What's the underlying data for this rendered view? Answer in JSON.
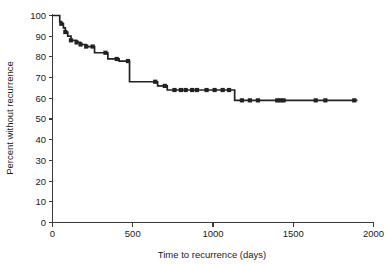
{
  "chart_data": {
    "type": "line",
    "title": "",
    "subtitle": "",
    "xlabel": "Time to recurrence (days)",
    "ylabel": "Percent without recurrence",
    "xlim": [
      0,
      2000
    ],
    "ylim": [
      0,
      100
    ],
    "xticks": [
      0,
      500,
      1000,
      1500,
      2000
    ],
    "xtick_labels": [
      "0",
      "500",
      "1000",
      "1500",
      "2000"
    ],
    "yticks": [
      0,
      10,
      20,
      30,
      40,
      50,
      60,
      70,
      80,
      90,
      100
    ],
    "ytick_labels": [
      "0",
      "10",
      "20",
      "30",
      "40",
      "50",
      "60",
      "70",
      "80",
      "90",
      "100"
    ],
    "grid": false,
    "legend": null,
    "legend_position": "none",
    "curve_style": "kaplan-meier step function with censoring marks",
    "series": [
      {
        "name": "Percent without recurrence",
        "step_points": [
          [
            0,
            100
          ],
          [
            40,
            100
          ],
          [
            45,
            97
          ],
          [
            55,
            96
          ],
          [
            68,
            94
          ],
          [
            80,
            92
          ],
          [
            95,
            90
          ],
          [
            115,
            88
          ],
          [
            150,
            87
          ],
          [
            175,
            86
          ],
          [
            210,
            85
          ],
          [
            250,
            85
          ],
          [
            262,
            82
          ],
          [
            330,
            82
          ],
          [
            345,
            79
          ],
          [
            400,
            79
          ],
          [
            415,
            78
          ],
          [
            470,
            78
          ],
          [
            480,
            68
          ],
          [
            640,
            68
          ],
          [
            655,
            66
          ],
          [
            700,
            66
          ],
          [
            715,
            64
          ],
          [
            1125,
            64
          ],
          [
            1135,
            59
          ],
          [
            1900,
            59
          ]
        ],
        "censor_days": [
          55,
          80,
          115,
          150,
          175,
          210,
          250,
          330,
          400,
          470,
          640,
          700,
          760,
          800,
          830,
          870,
          900,
          960,
          1010,
          1060,
          1100,
          1180,
          1230,
          1280,
          1400,
          1420,
          1440,
          1640,
          1700,
          1880
        ]
      }
    ]
  },
  "axes": {
    "y_axis_name": "percent-without-recurrence-axis",
    "x_axis_name": "time-to-recurrence-axis"
  }
}
